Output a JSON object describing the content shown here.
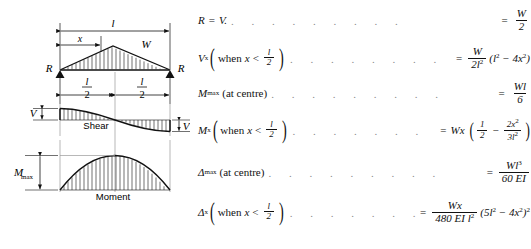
{
  "diagram": {
    "load": {
      "span_label": "l",
      "x_label": "x",
      "load_label": "W",
      "reaction_left": "R",
      "reaction_right": "R",
      "half_span_left_num": "l",
      "half_span_left_den": "2",
      "half_span_right_num": "l",
      "half_span_right_den": "2"
    },
    "shear": {
      "title": "Shear",
      "left_label": "V",
      "right_label": "V"
    },
    "moment": {
      "title": "Moment",
      "max_label": "M",
      "max_sub": "max"
    }
  },
  "formulas": [
    {
      "id": "reaction",
      "lhs_main": "R",
      "lhs_eq": "=",
      "lhs_var": "V.",
      "rhs_num": "W",
      "rhs_den": "2"
    },
    {
      "id": "shear-x",
      "lhs_main": "V",
      "lhs_sub": "x",
      "cond_when": "when",
      "cond_var": "x",
      "cond_rel": "<",
      "cond_num": "l",
      "cond_den": "2",
      "rhs_num": "W",
      "rhs_den": "2l",
      "rhs_den_sup": "2",
      "rhs_tail": "(l",
      "rhs_tail_sup1": "2",
      "rhs_tail_mid": " − 4x",
      "rhs_tail_sup2": "2",
      "rhs_tail_end": ")"
    },
    {
      "id": "moment-max",
      "lhs_main": "M",
      "lhs_sub": "max",
      "lhs_note": "(at centre)",
      "rhs_num": "Wl",
      "rhs_den": "6"
    },
    {
      "id": "moment-x",
      "lhs_main": "M",
      "lhs_sub": "x",
      "cond_when": "when",
      "cond_var": "x",
      "cond_rel": "<",
      "cond_num": "l",
      "cond_den": "2",
      "rhs_lead": "Wx",
      "rhs_f1_num": "1",
      "rhs_f1_den": "2",
      "rhs_minus": "−",
      "rhs_f2_num": "2x",
      "rhs_f2_num_sup": "2",
      "rhs_f2_den": "3l",
      "rhs_f2_den_sup": "2"
    },
    {
      "id": "deflection-max",
      "lhs_main": "Δ",
      "lhs_sub": "max",
      "lhs_note": "(at centre)",
      "rhs_num": "Wl",
      "rhs_num_sup": "3",
      "rhs_den": "60 EI"
    },
    {
      "id": "deflection-x",
      "lhs_main": "Δ",
      "lhs_sub": "x",
      "cond_when": "when",
      "cond_var": "x",
      "cond_rel": "<",
      "cond_num": "l",
      "cond_den": "2",
      "rhs_num": "Wx",
      "rhs_den": "480 EI l",
      "rhs_den_sup": "2",
      "rhs_tail": "(5l",
      "rhs_tail_sup1": "2",
      "rhs_tail_mid": " − 4x",
      "rhs_tail_sup2": "2",
      "rhs_tail_end": ")",
      "rhs_tail_sup3": "2"
    }
  ],
  "leader_dots": ". . . . . . . . ."
}
